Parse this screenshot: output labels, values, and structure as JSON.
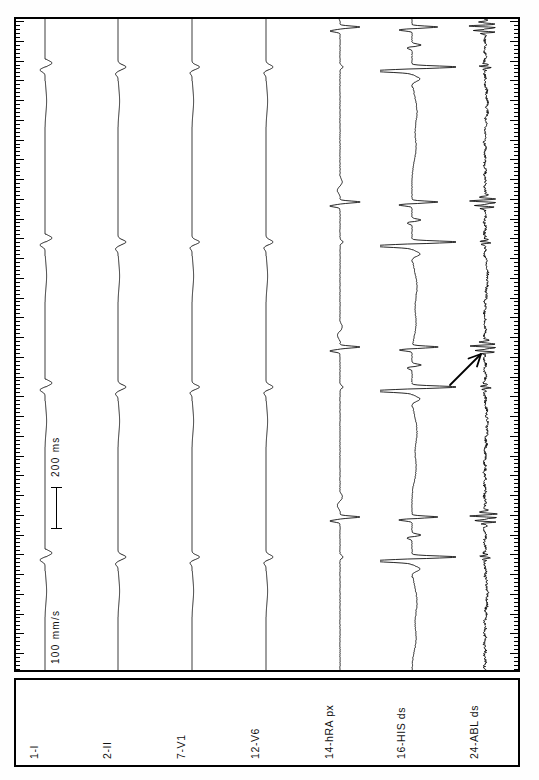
{
  "recording": {
    "title": "Intracardiac electrophysiology recording",
    "paper_speed_label": "100 mm/s",
    "time_scale_label": "200 ms",
    "orientation": "rotated-90"
  },
  "annotations": {
    "arrow": {
      "name": "pointer-arrow",
      "target_channel": "24-ABL ds",
      "direction": "up-right"
    }
  },
  "channels": [
    {
      "id": "ch1",
      "label": "1-I",
      "type": "surface-ecg",
      "baseline_x": 45,
      "lane_left": 16,
      "lane_width": 62
    },
    {
      "id": "ch2",
      "label": "2-II",
      "type": "surface-ecg",
      "baseline_x": 118,
      "lane_left": 90,
      "lane_width": 62
    },
    {
      "id": "ch3",
      "label": "7-V1",
      "type": "surface-ecg",
      "baseline_x": 192,
      "lane_left": 164,
      "lane_width": 62
    },
    {
      "id": "ch4",
      "label": "12-V6",
      "type": "surface-ecg",
      "baseline_x": 266,
      "lane_left": 238,
      "lane_width": 62
    },
    {
      "id": "ch5",
      "label": "14-hRA px",
      "type": "intracardiac",
      "baseline_x": 340,
      "lane_left": 310,
      "lane_width": 66
    },
    {
      "id": "ch6",
      "label": "16-HIS ds",
      "type": "intracardiac",
      "baseline_x": 412,
      "lane_left": 380,
      "lane_width": 76
    },
    {
      "id": "ch7",
      "label": "24-ABL ds",
      "type": "intracardiac",
      "baseline_x": 485,
      "lane_left": 455,
      "lane_width": 54
    }
  ],
  "chart_data": {
    "type": "line",
    "xlabel": "",
    "ylabel": "time",
    "time_axis": "vertical, top = earliest",
    "paper_speed_mm_per_s": 100,
    "scale_bar_ms": 200,
    "scale_bar_pixels": 42,
    "beat_times_px": [
      65,
      240,
      385,
      555
    ],
    "grid": false,
    "legend": "channel labels below plot",
    "series": [
      {
        "name": "1-I",
        "morphology": "small biphasic QRS",
        "amplitude_px": 9
      },
      {
        "name": "2-II",
        "morphology": "small upright QRS",
        "amplitude_px": 8
      },
      {
        "name": "7-V1",
        "morphology": "small rS complex",
        "amplitude_px": 8
      },
      {
        "name": "12-V6",
        "morphology": "small upright QRS",
        "amplitude_px": 8
      },
      {
        "name": "14-hRA px",
        "morphology": "discrete atrial spike with sharp deflection",
        "amplitude_px": 16
      },
      {
        "name": "16-HIS ds",
        "morphology": "large A-H-V complex, sharp high amplitude",
        "amplitude_px": 40
      },
      {
        "name": "24-ABL ds",
        "morphology": "fractionated low-amplitude continuous signal",
        "amplitude_px": 18
      }
    ]
  }
}
